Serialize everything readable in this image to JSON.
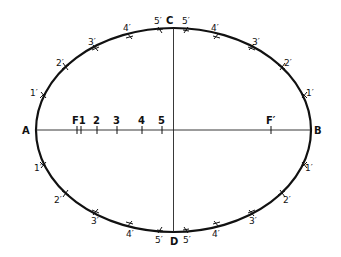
{
  "diagram": {
    "ellipse": {
      "cx": 173.5,
      "cy": 130,
      "rx": 137.5,
      "ry": 102
    },
    "axis_labels": {
      "A": "A",
      "B": "B",
      "C": "C",
      "D": "D"
    },
    "major_axis_points": [
      {
        "label": "F1",
        "x": 77
      },
      {
        "label": "2",
        "x": 97
      },
      {
        "label": "3",
        "x": 117
      },
      {
        "label": "4",
        "x": 142
      },
      {
        "label": "5",
        "x": 162
      }
    ],
    "focus_right": {
      "label": "F′",
      "x": 271
    },
    "arc_marks": {
      "top_left": [
        "1′",
        "2′",
        "3′",
        "4′",
        "5′"
      ],
      "top_right": [
        "5′",
        "4′",
        "3′",
        "2′",
        "1′"
      ],
      "bottom_left": [
        "1′",
        "2′",
        "3′",
        "4′",
        "5′"
      ],
      "bottom_right": [
        "5′",
        "4′",
        "3′",
        "2′",
        "1′"
      ]
    },
    "colors": {
      "line": "#111111",
      "background": "#ffffff"
    }
  }
}
